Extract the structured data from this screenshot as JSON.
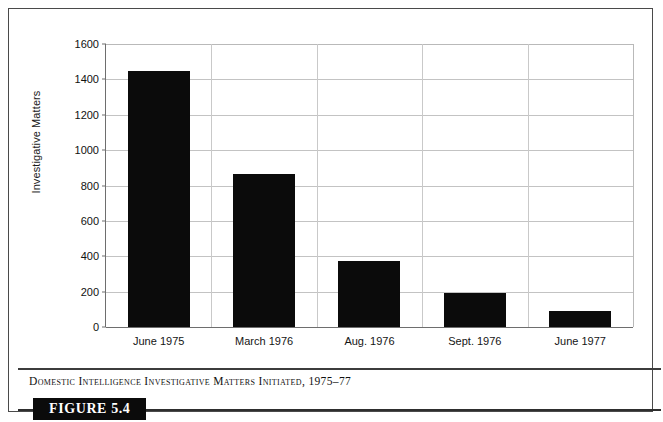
{
  "figure": {
    "badge_label": "FIGURE 5.4",
    "caption": "Domestic Intelligence Investigative Matters Initiated, 1975–77",
    "frame_color": "#4a4a4a",
    "badge_background": "#0b0b0b",
    "badge_text_color": "#ffffff"
  },
  "chart_data": {
    "type": "bar",
    "title": "",
    "subtitle": "",
    "xlabel": "",
    "ylabel": "Investigative Matters",
    "categories": [
      "June 1975",
      "March 1976",
      "Aug. 1976",
      "Sept. 1976",
      "June 1977"
    ],
    "values": [
      1450,
      865,
      375,
      195,
      90
    ],
    "series": [
      {
        "name": "Investigative Matters",
        "values": [
          1450,
          865,
          375,
          195,
          90
        ],
        "color": "#0b0b0b"
      }
    ],
    "ylim": [
      0,
      1600
    ],
    "ytick_step": 200,
    "yticks": [
      0,
      200,
      400,
      600,
      800,
      1000,
      1200,
      1400,
      1600
    ],
    "ytick_labels": [
      "0",
      "200",
      "400",
      "600",
      "800",
      "1000",
      "1200",
      "1400",
      "1600"
    ],
    "grid": "horizontal-and-vertical",
    "grid_color": "#c3c3c3",
    "legend": "none",
    "legend_position": "none",
    "bar_color": "#0b0b0b",
    "plot_background": "#ffffff",
    "annotations": []
  }
}
